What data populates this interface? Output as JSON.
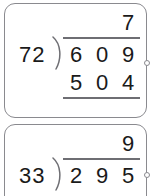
{
  "page": {
    "kind": "long-division-worksheet",
    "ink_color": "#1a1a1a",
    "rule_color": "#6e6e73",
    "card_border_color": "#8a8a8f",
    "card_background": "#ffffff"
  },
  "problems": [
    {
      "id": "problem-1",
      "divisor": "72",
      "quotient_digits": [
        "",
        "",
        "7"
      ],
      "dividend_digits": [
        "6",
        "0",
        "9"
      ],
      "work_rows": [
        {
          "digits": [
            "5",
            "0",
            "4"
          ],
          "underlined": true
        }
      ]
    },
    {
      "id": "problem-2",
      "divisor": "33",
      "quotient_digits": [
        "",
        "",
        "9"
      ],
      "dividend_digits": [
        "2",
        "9",
        "5"
      ],
      "work_rows": []
    }
  ],
  "icons": {
    "connector_dot": "circle-connector-icon",
    "division_bracket": "division-bracket-icon"
  }
}
